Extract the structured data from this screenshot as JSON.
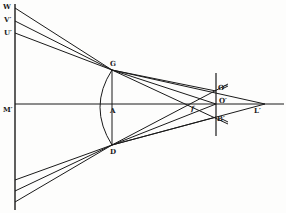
{
  "figure": {
    "type": "optics ray diagram (lens with focal points)",
    "ink_color": "#1a1a1a",
    "background": "#fdfdfc"
  },
  "labels": {
    "W": "W",
    "V": "V′",
    "U": "U′",
    "M": "M′",
    "G": "G",
    "A": "A",
    "D": "D",
    "f": "f",
    "O2": "O″",
    "O1": "O′",
    "B": "B′",
    "L": "L′"
  },
  "points": {
    "W": [
      15,
      8
    ],
    "V": [
      15,
      21
    ],
    "U": [
      15,
      33
    ],
    "M": [
      15,
      104
    ],
    "G": [
      112,
      70
    ],
    "A": [
      112,
      104
    ],
    "D": [
      112,
      145
    ],
    "f": [
      193,
      104
    ],
    "O2": [
      216,
      91
    ],
    "O1": [
      216,
      104
    ],
    "B": [
      216,
      117
    ],
    "L": [
      265,
      104
    ],
    "lower1": [
      15,
      180
    ],
    "lower2": [
      15,
      191
    ],
    "lower3": [
      15,
      202
    ]
  }
}
